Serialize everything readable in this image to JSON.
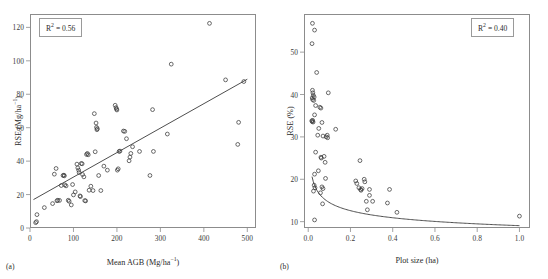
{
  "figure": {
    "panels": [
      {
        "id": "a",
        "label": "(a)",
        "annotation": "R² = 0.40 placeholder"
      }
    ]
  },
  "panel_a": {
    "label": "(a)",
    "r2_text": "R",
    "r2_sup": "2",
    "r2_value": " = 0.56",
    "xlabel_main": "Mean AGB (Mg/ha",
    "xlabel_sup": "−1",
    "xlabel_tail": ")",
    "ylabel_main": "RSE (Mg/ha",
    "ylabel_sup": "−1",
    "ylabel_tail": ")"
  },
  "panel_b": {
    "label": "(b)",
    "r2_text": "R",
    "r2_sup": "2",
    "r2_value": " = 0.40",
    "xlabel": "Plot size (ha)",
    "ylabel": "RSE (%)"
  },
  "style": {
    "marker_stroke": "#3a3a3a",
    "line_color": "#3a3a3a",
    "frame_color": "#8c8c8c",
    "text_color": "#2b2b2b",
    "background": "#ffffff"
  },
  "chart_data": [
    {
      "type": "scatter",
      "panel": "a",
      "title": "",
      "xlabel": "Mean AGB (Mg/ha−1)",
      "ylabel": "RSE (Mg/ha−1)",
      "annotation": "R2 = 0.56",
      "r_squared": 0.56,
      "xlim": [
        0,
        520
      ],
      "ylim": [
        0,
        128
      ],
      "xticks": [
        0,
        100,
        200,
        300,
        400,
        500
      ],
      "yticks": [
        0,
        20,
        40,
        60,
        80,
        100,
        120
      ],
      "grid": false,
      "legend": "none",
      "marker": "open-circle",
      "fit_line": {
        "type": "linear",
        "x_start": 8,
        "y_start": 17.0,
        "x_end": 500,
        "y_end": 89.0
      },
      "points": [
        [
          13,
          3.2
        ],
        [
          15,
          3.8
        ],
        [
          16,
          8.0
        ],
        [
          33,
          12.2
        ],
        [
          52,
          14.6
        ],
        [
          56,
          32.2
        ],
        [
          60,
          35.6
        ],
        [
          62,
          16.3
        ],
        [
          64,
          16.6
        ],
        [
          68,
          16.5
        ],
        [
          72,
          25.4
        ],
        [
          76,
          31.4
        ],
        [
          78,
          31.6
        ],
        [
          79,
          31.2
        ],
        [
          80,
          25.8
        ],
        [
          83,
          25.2
        ],
        [
          88,
          16.6
        ],
        [
          90,
          16.0
        ],
        [
          95,
          13.8
        ],
        [
          98,
          26.0
        ],
        [
          100,
          19.8
        ],
        [
          104,
          21.6
        ],
        [
          108,
          38.2
        ],
        [
          110,
          36.0
        ],
        [
          112,
          34.6
        ],
        [
          113,
          33.2
        ],
        [
          115,
          19.2
        ],
        [
          116,
          18.8
        ],
        [
          118,
          38.6
        ],
        [
          120,
          38.4
        ],
        [
          121,
          32.0
        ],
        [
          124,
          30.6
        ],
        [
          126,
          16.4
        ],
        [
          128,
          16.2
        ],
        [
          130,
          44.0
        ],
        [
          132,
          44.6
        ],
        [
          134,
          43.8
        ],
        [
          136,
          22.6
        ],
        [
          140,
          25.0
        ],
        [
          145,
          22.4
        ],
        [
          148,
          68.4
        ],
        [
          150,
          45.6
        ],
        [
          152,
          62.8
        ],
        [
          153,
          60.2
        ],
        [
          154,
          58.8
        ],
        [
          155,
          59.4
        ],
        [
          158,
          31.4
        ],
        [
          163,
          22.4
        ],
        [
          170,
          37.0
        ],
        [
          178,
          34.6
        ],
        [
          196,
          73.4
        ],
        [
          198,
          72.0
        ],
        [
          199,
          71.2
        ],
        [
          200,
          70.6
        ],
        [
          201,
          34.6
        ],
        [
          203,
          35.4
        ],
        [
          205,
          45.8
        ],
        [
          207,
          46.0
        ],
        [
          215,
          58.0
        ],
        [
          218,
          57.8
        ],
        [
          222,
          53.4
        ],
        [
          228,
          40.2
        ],
        [
          230,
          42.4
        ],
        [
          232,
          44.6
        ],
        [
          236,
          48.6
        ],
        [
          252,
          45.8
        ],
        [
          276,
          31.4
        ],
        [
          282,
          70.8
        ],
        [
          284,
          45.8
        ],
        [
          316,
          56.2
        ],
        [
          325,
          98.0
        ],
        [
          413,
          122.4
        ],
        [
          450,
          88.6
        ],
        [
          478,
          50.0
        ],
        [
          480,
          63.2
        ],
        [
          492,
          87.6
        ]
      ]
    },
    {
      "type": "scatter",
      "panel": "b",
      "title": "",
      "xlabel": "Plot size (ha)",
      "ylabel": "RSE (%)",
      "annotation": "R2 = 0.40",
      "r_squared": 0.4,
      "xlim": [
        -0.02,
        1.05
      ],
      "ylim": [
        8.5,
        59.0
      ],
      "xticks": [
        0.0,
        0.2,
        0.4,
        0.6,
        0.8,
        1.0
      ],
      "yticks": [
        10,
        20,
        30,
        40,
        50
      ],
      "grid": false,
      "legend": "none",
      "marker": "open-circle",
      "fit_curve": {
        "type": "power-decay",
        "a": 9.05,
        "b": -0.205,
        "offset": 0.0,
        "x_start": 0.018,
        "x_end": 1.0,
        "note": "y = a * x^b, decaying curve through cluster"
      },
      "points": [
        [
          0.02,
          56.8
        ],
        [
          0.03,
          55.2
        ],
        [
          0.018,
          52.0
        ],
        [
          0.04,
          45.2
        ],
        [
          0.02,
          41.0
        ],
        [
          0.022,
          40.4
        ],
        [
          0.024,
          39.8
        ],
        [
          0.019,
          39.2
        ],
        [
          0.021,
          38.8
        ],
        [
          0.026,
          38.6
        ],
        [
          0.028,
          39.4
        ],
        [
          0.095,
          40.4
        ],
        [
          0.035,
          37.4
        ],
        [
          0.055,
          37.0
        ],
        [
          0.06,
          36.8
        ],
        [
          0.03,
          35.2
        ],
        [
          0.017,
          33.8
        ],
        [
          0.019,
          33.6
        ],
        [
          0.021,
          33.9
        ],
        [
          0.023,
          33.5
        ],
        [
          0.065,
          33.4
        ],
        [
          0.05,
          32.0
        ],
        [
          0.13,
          31.8
        ],
        [
          0.045,
          30.4
        ],
        [
          0.07,
          30.2
        ],
        [
          0.085,
          30.0
        ],
        [
          0.09,
          30.4
        ],
        [
          0.092,
          29.8
        ],
        [
          0.035,
          26.4
        ],
        [
          0.06,
          25.2
        ],
        [
          0.062,
          25.0
        ],
        [
          0.075,
          25.4
        ],
        [
          0.08,
          24.0
        ],
        [
          0.245,
          24.4
        ],
        [
          0.03,
          21.2
        ],
        [
          0.048,
          22.0
        ],
        [
          0.082,
          20.2
        ],
        [
          0.225,
          19.6
        ],
        [
          0.23,
          19.0
        ],
        [
          0.265,
          20.0
        ],
        [
          0.268,
          19.4
        ],
        [
          0.028,
          18.6
        ],
        [
          0.032,
          18.0
        ],
        [
          0.065,
          18.2
        ],
        [
          0.07,
          17.8
        ],
        [
          0.24,
          18.0
        ],
        [
          0.248,
          17.6
        ],
        [
          0.25,
          17.4
        ],
        [
          0.255,
          17.8
        ],
        [
          0.29,
          17.6
        ],
        [
          0.385,
          17.6
        ],
        [
          0.025,
          17.2
        ],
        [
          0.058,
          16.8
        ],
        [
          0.29,
          16.2
        ],
        [
          0.068,
          14.2
        ],
        [
          0.275,
          14.8
        ],
        [
          0.305,
          14.8
        ],
        [
          0.375,
          14.4
        ],
        [
          0.28,
          12.8
        ],
        [
          0.42,
          12.2
        ],
        [
          0.03,
          10.4
        ],
        [
          1.0,
          11.3
        ]
      ]
    }
  ]
}
